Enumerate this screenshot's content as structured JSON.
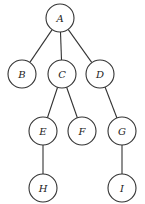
{
  "diagram": {
    "type": "tree",
    "nodes": [
      {
        "id": "A",
        "label": "A"
      },
      {
        "id": "B",
        "label": "B"
      },
      {
        "id": "C",
        "label": "C"
      },
      {
        "id": "D",
        "label": "D"
      },
      {
        "id": "E",
        "label": "E"
      },
      {
        "id": "F",
        "label": "F"
      },
      {
        "id": "G",
        "label": "G"
      },
      {
        "id": "H",
        "label": "H"
      },
      {
        "id": "I",
        "label": "I"
      }
    ],
    "edges": [
      {
        "from": "A",
        "to": "B"
      },
      {
        "from": "A",
        "to": "C"
      },
      {
        "from": "A",
        "to": "D"
      },
      {
        "from": "C",
        "to": "E"
      },
      {
        "from": "C",
        "to": "F"
      },
      {
        "from": "D",
        "to": "G"
      },
      {
        "from": "E",
        "to": "H"
      },
      {
        "from": "G",
        "to": "I"
      }
    ]
  }
}
